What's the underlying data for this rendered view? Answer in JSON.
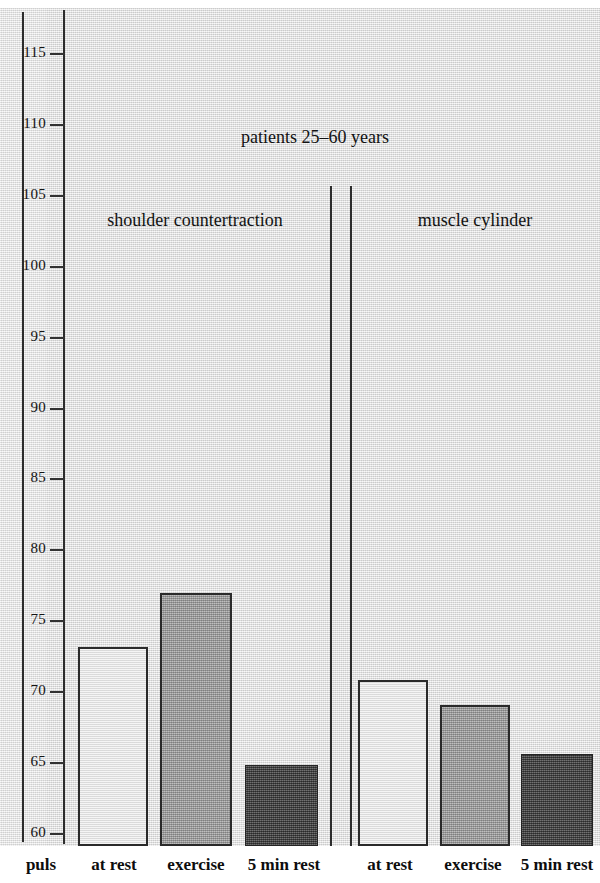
{
  "chart_data": {
    "type": "bar",
    "title": "patients 25–60 years",
    "xlabel": "",
    "ylabel": "puls",
    "ylim": [
      60,
      115
    ],
    "yticks": [
      60,
      65,
      70,
      75,
      80,
      85,
      90,
      95,
      100,
      105,
      110,
      115
    ],
    "ytick_labels": [
      "60",
      "65",
      "70",
      "75",
      "80",
      "85",
      "90",
      "95",
      "100",
      "105",
      "110",
      "115"
    ],
    "grid": false,
    "legend": "none",
    "groups": [
      {
        "name": "shoulder countertraction",
        "categories": [
          "at rest",
          "exercise",
          "5 min rest"
        ],
        "values": [
          73.1,
          76.9,
          64.8
        ],
        "styles": [
          "open",
          "mid-gray",
          "dark-gray"
        ]
      },
      {
        "name": "muscle cylinder",
        "categories": [
          "at rest",
          "exercise",
          "5 min rest"
        ],
        "values": [
          70.8,
          69.0,
          65.6
        ],
        "styles": [
          "open",
          "mid-gray",
          "dark-gray"
        ]
      }
    ],
    "categories": [
      "at rest",
      "exercise",
      "5 min rest",
      "at rest",
      "exercise",
      "5 min rest"
    ],
    "values": [
      73.1,
      76.9,
      64.8,
      70.8,
      69.0,
      65.6
    ],
    "colors": {
      "open_bar": "#e6e6e6",
      "mid_bar": "#9a9a9a",
      "dark_bar": "#4a4a4a",
      "outline": "#2a2a2a",
      "background": "#e3e3e3",
      "text": "#121212"
    }
  },
  "axis": {
    "y_axis_caption": "puls",
    "ticks": [
      {
        "value": "115",
        "y": 53
      },
      {
        "value": "110",
        "y": 124
      },
      {
        "value": "105",
        "y": 195
      },
      {
        "value": "100",
        "y": 266
      },
      {
        "value": "95",
        "y": 337
      },
      {
        "value": "90",
        "y": 408
      },
      {
        "value": "85",
        "y": 478
      },
      {
        "value": "80",
        "y": 549
      },
      {
        "value": "75",
        "y": 620
      },
      {
        "value": "70",
        "y": 691
      },
      {
        "value": "65",
        "y": 762
      },
      {
        "value": "60",
        "y": 833
      }
    ]
  },
  "labels": {
    "group_1": "shoulder countertraction",
    "group_2": "muscle cylinder",
    "x1": "at rest",
    "x2": "exercise",
    "x3": "5 min rest",
    "x4": "at rest",
    "x5": "exercise",
    "x6": "5 min rest"
  }
}
